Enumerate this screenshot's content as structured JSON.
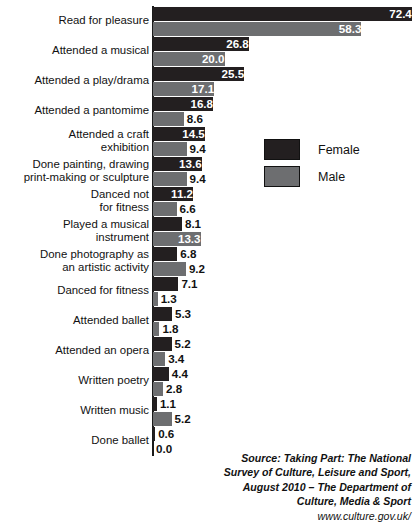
{
  "chart_data": {
    "type": "bar",
    "orientation": "horizontal",
    "title": "Arts participation by gender",
    "xlabel": "",
    "ylabel": "",
    "grid": false,
    "legend_position": "inside-upper-right",
    "xlim": [
      0,
      72.4
    ],
    "categories": [
      "Read for pleasure",
      "Attended a musical",
      "Attended a play/drama",
      "Attended a pantomime",
      "Attended a craft exhibition",
      "Done painting, drawing print-making or sculpture",
      "Danced not for fitness",
      "Played a musical instrument",
      "Done photography as an artistic activity",
      "Danced for fitness",
      "Attended ballet",
      "Attended an opera",
      "Written poetry",
      "Written music",
      "Done ballet"
    ],
    "category_lines": [
      [
        "Read for pleasure"
      ],
      [
        "Attended a musical"
      ],
      [
        "Attended a play/drama"
      ],
      [
        "Attended a pantomime"
      ],
      [
        "Attended a craft",
        "exhibition"
      ],
      [
        "Done painting, drawing",
        "print-making or sculpture"
      ],
      [
        "Danced not",
        "for fitness"
      ],
      [
        "Played a musical",
        "instrument"
      ],
      [
        "Done photography as",
        "an artistic activity"
      ],
      [
        "Danced for fitness"
      ],
      [
        "Attended ballet"
      ],
      [
        "Attended an opera"
      ],
      [
        "Written poetry"
      ],
      [
        "Written music"
      ],
      [
        "Done ballet"
      ]
    ],
    "series": [
      {
        "name": "Female",
        "color": "#231f20",
        "values": [
          72.4,
          26.8,
          25.5,
          16.8,
          14.5,
          13.6,
          11.2,
          8.1,
          6.8,
          7.1,
          5.3,
          5.2,
          4.4,
          1.1,
          0.6
        ],
        "labels": [
          "72.4",
          "26.8",
          "25.5",
          "16.8",
          "14.5",
          "13.6",
          "11.2",
          "8.1",
          "6.8",
          "7.1",
          "5.3",
          "5.2",
          "4.4",
          "1.1",
          "0.6"
        ]
      },
      {
        "name": "Male",
        "color": "#6d6e70",
        "values": [
          58.3,
          20.0,
          17.1,
          8.6,
          9.4,
          9.4,
          6.6,
          13.3,
          9.2,
          1.3,
          1.8,
          3.4,
          2.8,
          5.2,
          0.0
        ],
        "labels": [
          "58.3",
          "20.0",
          "17.1",
          "8.6",
          "9.4",
          "9.4",
          "6.6",
          "13.3",
          "9.2",
          "1.3",
          "1.8",
          "3.4",
          "2.8",
          "5.2",
          "0.0"
        ]
      }
    ]
  },
  "legend": {
    "items": [
      {
        "label": "Female",
        "color": "#231f20",
        "key": "female"
      },
      {
        "label": "Male",
        "color": "#6d6e70",
        "key": "male"
      }
    ]
  },
  "source_note": {
    "lines": [
      "Source: Taking Part: The National",
      "Survey of Culture, Leisure and Sport,",
      "August 2010 – The Department of",
      "Culture, Media & Sport"
    ],
    "url": "www.culture.gov.uk/"
  },
  "colors": {
    "female": "#231f20",
    "male": "#6d6e70",
    "background": "#ffffff",
    "text": "#111111"
  }
}
